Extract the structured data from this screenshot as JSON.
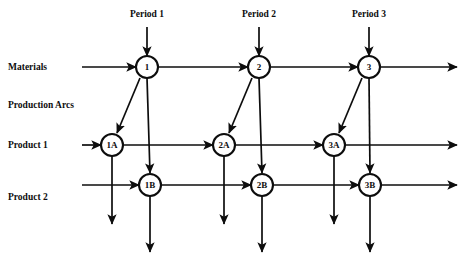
{
  "diagram": {
    "canvas": {
      "width": 470,
      "height": 263,
      "background": "#ffffff"
    },
    "stroke_color": "#0d0d0d",
    "row_labels": [
      {
        "id": "materials",
        "text": "Materials"
      },
      {
        "id": "production-arcs",
        "text": "Production Arcs"
      },
      {
        "id": "product-1",
        "text": "Product 1"
      },
      {
        "id": "product-2",
        "text": "Product 2"
      }
    ],
    "period_labels": [
      {
        "id": "period-1",
        "text": "Period 1"
      },
      {
        "id": "period-2",
        "text": "Period 2"
      },
      {
        "id": "period-3",
        "text": "Period 3"
      }
    ],
    "nodes": [
      {
        "id": "n1",
        "label": "1",
        "row": "materials",
        "period": 1
      },
      {
        "id": "n2",
        "label": "2",
        "row": "materials",
        "period": 2
      },
      {
        "id": "n3",
        "label": "3",
        "row": "materials",
        "period": 3
      },
      {
        "id": "n1a",
        "label": "1A",
        "row": "product-1",
        "period": 1
      },
      {
        "id": "n2a",
        "label": "2A",
        "row": "product-1",
        "period": 2
      },
      {
        "id": "n3a",
        "label": "3A",
        "row": "product-1",
        "period": 3
      },
      {
        "id": "n1b",
        "label": "1B",
        "row": "product-2",
        "period": 1
      },
      {
        "id": "n2b",
        "label": "2B",
        "row": "product-2",
        "period": 2
      },
      {
        "id": "n3b",
        "label": "3B",
        "row": "product-2",
        "period": 3
      }
    ]
  }
}
